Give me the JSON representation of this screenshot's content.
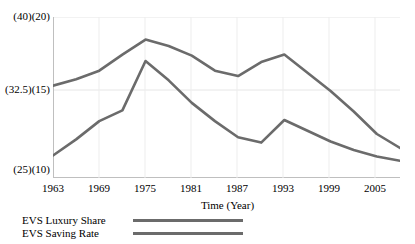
{
  "chart_data": {
    "type": "line",
    "title": "",
    "xlabel": "Time (Year)",
    "ylabel": "",
    "grid": true,
    "legend_position": "bottom-left",
    "xlim": [
      1963,
      2008
    ],
    "ylim_left": [
      25,
      40
    ],
    "ylim_right": [
      10,
      20
    ],
    "xticks": [
      "1963",
      "1969",
      "1975",
      "1981",
      "1987",
      "1993",
      "1999",
      "2005"
    ],
    "xtick_values": [
      1963,
      1969,
      1975,
      1981,
      1987,
      1993,
      1999,
      2005
    ],
    "yticks": [
      "(25)(10)",
      "(32.5)(15)",
      "(40)(20)"
    ],
    "ytick_values": [
      25,
      32.5,
      40
    ],
    "x": [
      1963,
      1966,
      1969,
      1972,
      1975,
      1978,
      1981,
      1984,
      1987,
      1990,
      1993,
      1996,
      1999,
      2002,
      2005,
      2008
    ],
    "series": [
      {
        "name": "EVS Luxury Share",
        "color": "#6b6b6b",
        "values": [
          33.6,
          34.2,
          35.0,
          36.5,
          37.9,
          37.3,
          36.4,
          35.0,
          34.5,
          35.8,
          36.5,
          34.8,
          33.1,
          31.2,
          29.1,
          27.8
        ]
      },
      {
        "name": "EVS Saving Rate",
        "color": "#6b6b6b",
        "values": [
          27.1,
          28.6,
          30.3,
          31.3,
          35.9,
          34.1,
          32.0,
          30.3,
          28.8,
          28.3,
          30.4,
          29.4,
          28.4,
          27.6,
          27.0,
          26.6
        ]
      }
    ]
  },
  "axis": {
    "ytick_top": "(40)(20)",
    "ytick_mid": "(32.5)(15)",
    "ytick_bottom": "(25)(10)",
    "x_title": "Time (Year)",
    "xticks": [
      {
        "label": "1963"
      },
      {
        "label": "1969"
      },
      {
        "label": "1975"
      },
      {
        "label": "1981"
      },
      {
        "label": "1987"
      },
      {
        "label": "1993"
      },
      {
        "label": "1999"
      },
      {
        "label": "2005"
      }
    ]
  },
  "legend": {
    "items": [
      {
        "label": "EVS Luxury Share",
        "color": "#6b6b6b"
      },
      {
        "label": "EVS Saving Rate",
        "color": "#6b6b6b"
      }
    ]
  },
  "colors": {
    "line": "#6b6b6b",
    "grid": "#e4e4e4",
    "axis": "#b9b9b9",
    "text": "#000000",
    "background": "#ffffff"
  }
}
